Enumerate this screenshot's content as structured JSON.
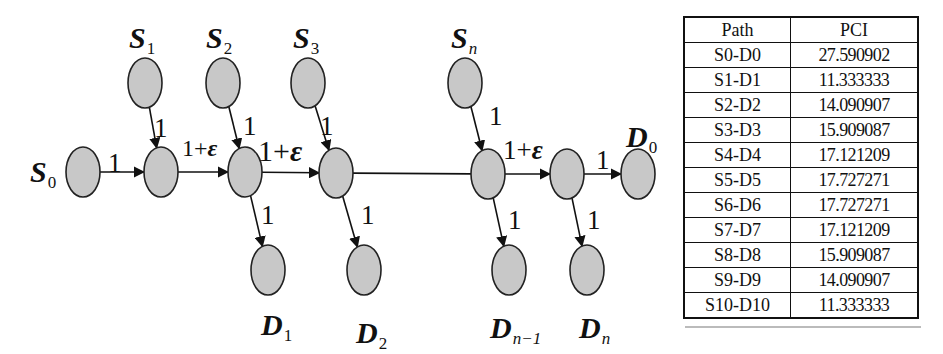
{
  "diagram": {
    "nodes": [
      {
        "id": "S0",
        "label": "S",
        "sub": "0",
        "cx": 83,
        "cy": 172
      },
      {
        "id": "C1",
        "label": "",
        "cx": 161,
        "cy": 172
      },
      {
        "id": "C2",
        "label": "",
        "cx": 245,
        "cy": 172
      },
      {
        "id": "C3",
        "label": "",
        "cx": 336,
        "cy": 173
      },
      {
        "id": "Cn",
        "label": "",
        "cx": 488,
        "cy": 174
      },
      {
        "id": "Cn1",
        "label": "",
        "cx": 567,
        "cy": 174
      },
      {
        "id": "D0",
        "label": "D",
        "sub": "0",
        "cx": 638,
        "cy": 174
      },
      {
        "id": "S1",
        "label": "S",
        "sub": "1",
        "cx": 145,
        "cy": 83
      },
      {
        "id": "S2",
        "label": "S",
        "sub": "2",
        "cx": 223,
        "cy": 83
      },
      {
        "id": "S3",
        "label": "S",
        "sub": "3",
        "cx": 308,
        "cy": 83
      },
      {
        "id": "Sn",
        "label": "S",
        "sub": "n",
        "cx": 465,
        "cy": 83
      },
      {
        "id": "D1",
        "label": "D",
        "sub": "1",
        "cx": 268,
        "cy": 270
      },
      {
        "id": "D2",
        "label": "D",
        "sub": "2",
        "cx": 364,
        "cy": 270
      },
      {
        "id": "Dn-1",
        "label": "D",
        "sub": "n−1",
        "cx": 509,
        "cy": 270
      },
      {
        "id": "Dn",
        "label": "D",
        "sub": "n",
        "cx": 587,
        "cy": 270
      }
    ],
    "edges": [
      {
        "from": "S0",
        "to": "C1",
        "weight": "1"
      },
      {
        "from": "S1",
        "to": "C1",
        "weight": "1"
      },
      {
        "from": "C1",
        "to": "C2",
        "weight": "1+ε"
      },
      {
        "from": "S2",
        "to": "C2",
        "weight": "1"
      },
      {
        "from": "C2",
        "to": "C3",
        "weight": "1+ε"
      },
      {
        "from": "S3",
        "to": "C3",
        "weight": "1"
      },
      {
        "from": "C2",
        "to": "D1",
        "weight": "1"
      },
      {
        "from": "C3",
        "to": "D2",
        "weight": "1"
      },
      {
        "from": "C3",
        "to": "Cn",
        "weight": ""
      },
      {
        "from": "Sn",
        "to": "Cn",
        "weight": "1"
      },
      {
        "from": "Cn",
        "to": "Cn1",
        "weight": "1+ε"
      },
      {
        "from": "Cn1",
        "to": "D0",
        "weight": "1"
      },
      {
        "from": "Cn",
        "to": "Dn-1",
        "weight": "1"
      },
      {
        "from": "Cn1",
        "to": "Dn",
        "weight": "1"
      }
    ],
    "labels": {
      "s0": {
        "main": "S",
        "sub": "0"
      },
      "s1": {
        "main": "S",
        "sub": "1"
      },
      "s2": {
        "main": "S",
        "sub": "2"
      },
      "s3": {
        "main": "S",
        "sub": "3"
      },
      "sn": {
        "main": "S",
        "sub": "n"
      },
      "d0": {
        "main": "D",
        "sub": "0"
      },
      "d1": {
        "main": "D",
        "sub": "1"
      },
      "d2": {
        "main": "D",
        "sub": "2"
      },
      "dn1": {
        "main": "D",
        "sub": "n−1"
      },
      "dn": {
        "main": "D",
        "sub": "n"
      }
    },
    "weights": {
      "one": "1",
      "one_plus": "1+",
      "epsilon": "ε"
    },
    "colors": {
      "node_fill": "#c8c8c8",
      "node_stroke": "#222222",
      "edge": "#111111"
    }
  },
  "table": {
    "headers": [
      "Path",
      "PCI"
    ],
    "rows": [
      [
        "S0-D0",
        "27.590902"
      ],
      [
        "S1-D1",
        "11.333333"
      ],
      [
        "S2-D2",
        "14.090907"
      ],
      [
        "S3-D3",
        "15.909087"
      ],
      [
        "S4-D4",
        "17.121209"
      ],
      [
        "S5-D5",
        "17.727271"
      ],
      [
        "S6-D6",
        "17.727271"
      ],
      [
        "S7-D7",
        "17.121209"
      ],
      [
        "S8-D8",
        "15.909087"
      ],
      [
        "S9-D9",
        "14.090907"
      ],
      [
        "S10-D10",
        "11.333333"
      ]
    ]
  }
}
